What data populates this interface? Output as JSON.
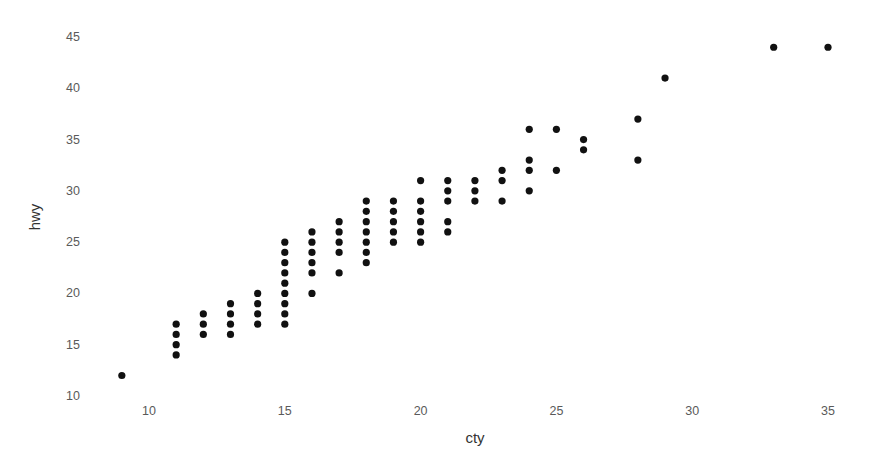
{
  "chart_data": {
    "type": "scatter",
    "title": "",
    "xlabel": "cty",
    "ylabel": "hwy",
    "xlim": [
      8.2,
      36.2
    ],
    "ylim": [
      10,
      45.5
    ],
    "x_ticks": [
      10,
      15,
      20,
      25,
      30,
      35
    ],
    "y_ticks": [
      10,
      15,
      20,
      25,
      30,
      35,
      40,
      45
    ],
    "grid": false,
    "legend": null,
    "point_color": "#111111",
    "points": [
      {
        "x": 9,
        "y": 12
      },
      {
        "x": 11,
        "y": 14
      },
      {
        "x": 11,
        "y": 15
      },
      {
        "x": 11,
        "y": 16
      },
      {
        "x": 11,
        "y": 17
      },
      {
        "x": 12,
        "y": 16
      },
      {
        "x": 12,
        "y": 17
      },
      {
        "x": 12,
        "y": 18
      },
      {
        "x": 13,
        "y": 16
      },
      {
        "x": 13,
        "y": 17
      },
      {
        "x": 13,
        "y": 18
      },
      {
        "x": 13,
        "y": 19
      },
      {
        "x": 14,
        "y": 17
      },
      {
        "x": 14,
        "y": 18
      },
      {
        "x": 14,
        "y": 19
      },
      {
        "x": 14,
        "y": 20
      },
      {
        "x": 15,
        "y": 17
      },
      {
        "x": 15,
        "y": 18
      },
      {
        "x": 15,
        "y": 19
      },
      {
        "x": 15,
        "y": 20
      },
      {
        "x": 15,
        "y": 21
      },
      {
        "x": 15,
        "y": 22
      },
      {
        "x": 15,
        "y": 23
      },
      {
        "x": 15,
        "y": 24
      },
      {
        "x": 15,
        "y": 25
      },
      {
        "x": 16,
        "y": 20
      },
      {
        "x": 16,
        "y": 22
      },
      {
        "x": 16,
        "y": 23
      },
      {
        "x": 16,
        "y": 24
      },
      {
        "x": 16,
        "y": 25
      },
      {
        "x": 16,
        "y": 26
      },
      {
        "x": 17,
        "y": 22
      },
      {
        "x": 17,
        "y": 24
      },
      {
        "x": 17,
        "y": 25
      },
      {
        "x": 17,
        "y": 26
      },
      {
        "x": 17,
        "y": 27
      },
      {
        "x": 18,
        "y": 23
      },
      {
        "x": 18,
        "y": 24
      },
      {
        "x": 18,
        "y": 25
      },
      {
        "x": 18,
        "y": 26
      },
      {
        "x": 18,
        "y": 27
      },
      {
        "x": 18,
        "y": 28
      },
      {
        "x": 18,
        "y": 29
      },
      {
        "x": 19,
        "y": 25
      },
      {
        "x": 19,
        "y": 26
      },
      {
        "x": 19,
        "y": 27
      },
      {
        "x": 19,
        "y": 28
      },
      {
        "x": 19,
        "y": 29
      },
      {
        "x": 20,
        "y": 25
      },
      {
        "x": 20,
        "y": 26
      },
      {
        "x": 20,
        "y": 27
      },
      {
        "x": 20,
        "y": 28
      },
      {
        "x": 20,
        "y": 29
      },
      {
        "x": 20,
        "y": 31
      },
      {
        "x": 21,
        "y": 26
      },
      {
        "x": 21,
        "y": 27
      },
      {
        "x": 21,
        "y": 29
      },
      {
        "x": 21,
        "y": 30
      },
      {
        "x": 21,
        "y": 31
      },
      {
        "x": 22,
        "y": 29
      },
      {
        "x": 22,
        "y": 30
      },
      {
        "x": 22,
        "y": 31
      },
      {
        "x": 23,
        "y": 29
      },
      {
        "x": 23,
        "y": 31
      },
      {
        "x": 23,
        "y": 32
      },
      {
        "x": 24,
        "y": 30
      },
      {
        "x": 24,
        "y": 32
      },
      {
        "x": 24,
        "y": 33
      },
      {
        "x": 24,
        "y": 36
      },
      {
        "x": 25,
        "y": 32
      },
      {
        "x": 25,
        "y": 36
      },
      {
        "x": 26,
        "y": 34
      },
      {
        "x": 26,
        "y": 35
      },
      {
        "x": 28,
        "y": 33
      },
      {
        "x": 28,
        "y": 37
      },
      {
        "x": 29,
        "y": 41
      },
      {
        "x": 33,
        "y": 44
      },
      {
        "x": 35,
        "y": 44
      }
    ]
  }
}
